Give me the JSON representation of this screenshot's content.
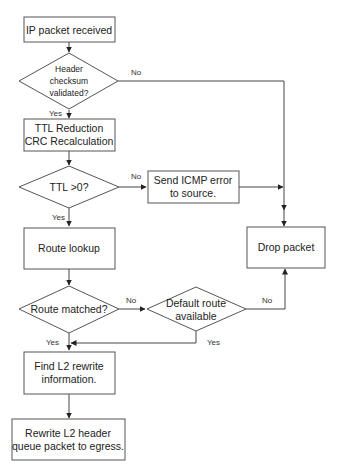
{
  "diagram": {
    "nodes": {
      "ip_received": {
        "type": "process",
        "lines": [
          "IP packet received"
        ]
      },
      "checksum": {
        "type": "decision",
        "lines": [
          "Header",
          "checksum",
          "validated?"
        ]
      },
      "ttl_reduction": {
        "type": "process",
        "lines": [
          "TTL Reduction",
          "CRC Recalculation"
        ]
      },
      "ttl_check": {
        "type": "decision",
        "lines": [
          "TTL >0?"
        ]
      },
      "send_icmp": {
        "type": "process",
        "lines": [
          "Send ICMP error",
          "to source."
        ]
      },
      "route_lookup": {
        "type": "process",
        "lines": [
          "Route lookup"
        ]
      },
      "drop_packet": {
        "type": "process",
        "lines": [
          "Drop packet"
        ]
      },
      "route_matched": {
        "type": "decision",
        "lines": [
          "Route matched?"
        ]
      },
      "default_route": {
        "type": "decision",
        "lines": [
          "Default route",
          "available"
        ]
      },
      "find_l2": {
        "type": "process",
        "lines": [
          "Find L2 rewrite",
          "information."
        ]
      },
      "rewrite_l2": {
        "type": "process",
        "lines": [
          "Rewrite L2 header",
          "queue packet to egress."
        ]
      }
    },
    "edge_labels": {
      "checksum_no": "No",
      "checksum_yes": "Yes",
      "ttl_no": "No",
      "ttl_yes": "Yes",
      "route_no": "No",
      "route_yes": "Yes",
      "default_no": "No",
      "default_yes": "Yes"
    }
  }
}
